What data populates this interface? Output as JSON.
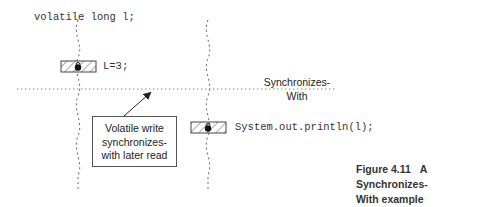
{
  "diagram": {
    "declaration": "volatile long l;",
    "write_statement": "L=3;",
    "read_statement": "System.out.println(l);",
    "sync_label_line1": "Synchronizes-",
    "sync_label_line2": "With",
    "callout": {
      "line1": "Volatile write",
      "line2": "synchronizes-",
      "line3": "with later read"
    },
    "icons": {
      "write_lock": "lock-icon",
      "read_lock": "lock-icon",
      "arrow": "arrow-up-right-icon"
    },
    "colors": {
      "line": "#666666",
      "text": "#333333",
      "background": "#ffffff"
    }
  },
  "caption": {
    "number": "Figure 4.11",
    "title_line1": "A Synchronizes-",
    "title_line2": "With example"
  }
}
